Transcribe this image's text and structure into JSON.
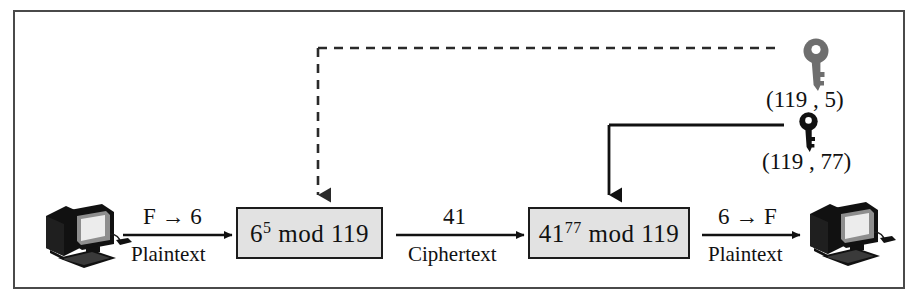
{
  "diagram": {
    "type": "flow-diagram",
    "background_color": "#ffffff",
    "frame_color": "#4a4a4a",
    "box_fill_color": "#e2e2e2",
    "box_border_color": "#1c1c1c",
    "public_key_color": "#6e6e6e",
    "private_key_color": "#111111"
  },
  "nodes": {
    "sender_computer": {
      "name": "sender-computer",
      "alt": "desktop computer"
    },
    "receiver_computer": {
      "name": "receiver-computer",
      "alt": "desktop computer"
    },
    "encrypt_box": {
      "base": "6",
      "exponent": "5",
      "mod_word": "mod",
      "modulus": "119",
      "full_text": "6^5 mod 119"
    },
    "decrypt_box": {
      "base": "41",
      "exponent": "77",
      "mod_word": "mod",
      "modulus": "119",
      "full_text": "41^77 mod 119"
    }
  },
  "edges": {
    "sender_to_encrypt": {
      "above": "F → 6",
      "below": "Plaintext"
    },
    "encrypt_to_decrypt": {
      "above": "41",
      "below": "Ciphertext"
    },
    "decrypt_to_receiver": {
      "above": "6 → F",
      "below": "Plaintext"
    }
  },
  "keys": {
    "public_key": {
      "label": "(119 , 5)",
      "modulus": "119",
      "exponent": "5",
      "style": "dashed",
      "color": "#6e6e6e",
      "icon": "key-icon"
    },
    "private_key": {
      "label": "(119 , 77)",
      "modulus": "119",
      "exponent": "77",
      "style": "solid",
      "color": "#111111",
      "icon": "key-icon"
    }
  }
}
